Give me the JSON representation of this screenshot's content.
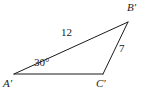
{
  "figure": {
    "type": "triangle-diagram",
    "background_color": "#ffffff",
    "stroke_color": "#1a1a1a",
    "stroke_width": 1,
    "width": 149,
    "height": 97,
    "vertices": {
      "A": {
        "label": "A′",
        "x": 14,
        "y": 74
      },
      "B": {
        "label": "B′",
        "x": 128,
        "y": 22
      },
      "C": {
        "label": "C′",
        "x": 103,
        "y": 74
      }
    },
    "sides": [
      {
        "name": "A-to-B",
        "label": "12",
        "from": "A",
        "to": "B"
      },
      {
        "name": "B-to-C",
        "label": "7",
        "from": "B",
        "to": "C"
      },
      {
        "name": "A-to-C",
        "label": "",
        "from": "A",
        "to": "C"
      }
    ],
    "angles": [
      {
        "at": "A",
        "label": "30°",
        "value": 30,
        "unit": "degrees"
      }
    ]
  }
}
